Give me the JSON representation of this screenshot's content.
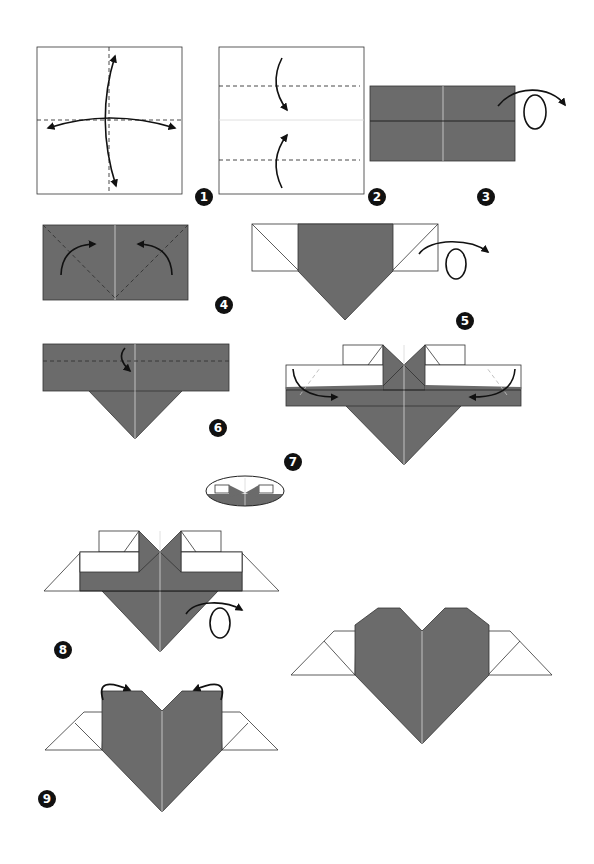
{
  "diagram": {
    "title": "",
    "colors": {
      "paper_front": "#6b6b6b",
      "paper_back": "#ffffff",
      "outline": "#333333",
      "badge": "#111111"
    },
    "steps": [
      {
        "number": "1",
        "action": "fold-and-unfold in half both ways",
        "icon": "fold-unfold-arrows"
      },
      {
        "number": "2",
        "action": "fold top and bottom edges to center",
        "icon": "valley-fold-arrows"
      },
      {
        "number": "3",
        "action": "turn over",
        "icon": "turn-over-arrow"
      },
      {
        "number": "4",
        "action": "fold top corners down along diagonals",
        "icon": "valley-fold-arrows"
      },
      {
        "number": "5",
        "action": "turn over",
        "icon": "turn-over-arrow"
      },
      {
        "number": "6",
        "action": "fold top edge down",
        "icon": "valley-fold-arrow"
      },
      {
        "number": "7",
        "action": "fold outer corners inward; detail inset shown",
        "icon": "valley-fold-arrows"
      },
      {
        "number": "8",
        "action": "turn over",
        "icon": "turn-over-arrow"
      },
      {
        "number": "9",
        "action": "fold top corners behind",
        "icon": "mountain-fold-arrows"
      }
    ],
    "final": {
      "label": "",
      "description": "finished winged heart"
    }
  }
}
